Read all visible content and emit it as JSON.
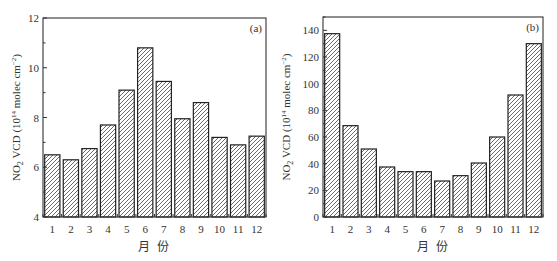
{
  "chart_data": [
    {
      "type": "bar",
      "panel_label": "(a)",
      "title": "",
      "xlabel": "月 份",
      "ylabel": "NO2 VCD (10^14 molec cm^-2)",
      "categories": [
        "1",
        "2",
        "3",
        "4",
        "5",
        "6",
        "7",
        "8",
        "9",
        "10",
        "11",
        "12"
      ],
      "values": [
        6.5,
        6.3,
        6.75,
        7.7,
        9.1,
        10.8,
        9.45,
        7.95,
        8.6,
        7.2,
        6.9,
        7.25
      ],
      "ylim": [
        4,
        12
      ],
      "yticks": [
        4,
        6,
        8,
        10,
        12
      ],
      "grid": false,
      "fill": "hatched"
    },
    {
      "type": "bar",
      "panel_label": "(b)",
      "title": "",
      "xlabel": "月 份",
      "ylabel": "NO2 VCD (10^14 molec cm^-2)",
      "categories": [
        "1",
        "2",
        "3",
        "4",
        "5",
        "6",
        "7",
        "8",
        "9",
        "10",
        "11",
        "12"
      ],
      "values": [
        137.5,
        68.5,
        51,
        37.5,
        34,
        34,
        27,
        31,
        40.5,
        60,
        91.5,
        130
      ],
      "ylim": [
        0,
        150
      ],
      "yticks": [
        0,
        20,
        40,
        60,
        80,
        100,
        120,
        140
      ],
      "grid": false,
      "fill": "hatched"
    }
  ],
  "labels": {
    "panel_a": "(a)",
    "panel_b": "(b)",
    "xlabel": "月 份",
    "ylabel_main": "NO",
    "ylabel_sub": "2",
    "ylabel_mid": " VCD (10",
    "ylabel_sup1": "14",
    "ylabel_mid2": " molec cm",
    "ylabel_sup2": "−2",
    "ylabel_end": ")"
  },
  "colors": {
    "axis": "#333333",
    "bar_stroke": "#222222",
    "hatch": "#444444",
    "bar_fill": "#ffffff"
  }
}
